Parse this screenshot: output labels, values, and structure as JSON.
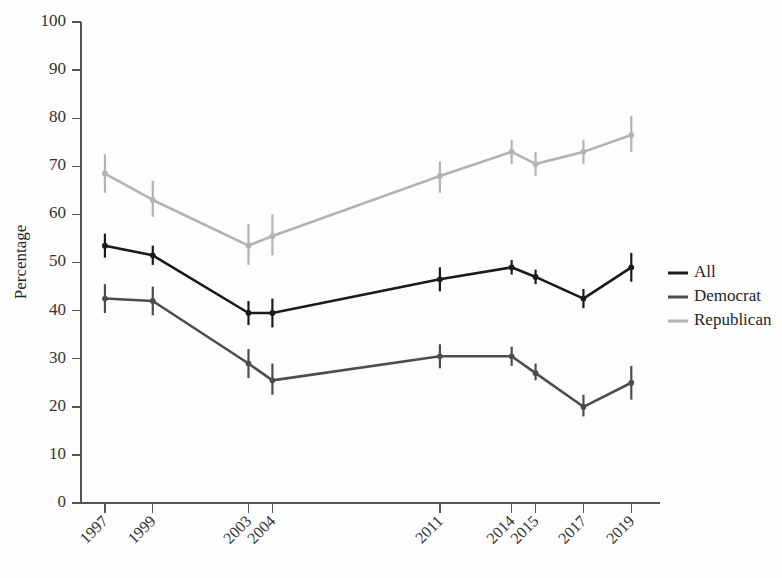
{
  "chart_data": {
    "type": "line",
    "title": "",
    "subtitle": "",
    "xlabel": "",
    "ylabel": "Percentage",
    "categories": [
      "1997",
      "1999",
      "2003",
      "2004",
      "2011",
      "2014",
      "2015",
      "2017",
      "2019"
    ],
    "x_positions": [
      1997,
      1999,
      2003,
      2004,
      2011,
      2014,
      2015,
      2017,
      2019
    ],
    "xlim": [
      1996.0,
      2020.2
    ],
    "ylim": [
      0,
      100
    ],
    "yticks": [
      0,
      10,
      20,
      30,
      40,
      50,
      60,
      70,
      80,
      90,
      100
    ],
    "ytick_labels": [
      "0",
      "10",
      "20",
      "30",
      "40",
      "50",
      "60",
      "70",
      "80",
      "90",
      "100"
    ],
    "grid": false,
    "error_bars": true,
    "legend_position": "right",
    "series": [
      {
        "name": "All",
        "color": "#1a1a1a",
        "values": [
          53.5,
          51.5,
          39.5,
          39.5,
          46.5,
          49.0,
          47.0,
          42.5,
          49.0
        ],
        "err_low": [
          51.0,
          49.5,
          37.0,
          36.5,
          44.0,
          47.5,
          45.5,
          40.5,
          46.0
        ],
        "err_high": [
          56.0,
          53.5,
          42.0,
          42.5,
          49.0,
          50.5,
          48.5,
          44.5,
          52.0
        ]
      },
      {
        "name": "Democrat",
        "color": "#4d4d4d",
        "values": [
          42.5,
          42.0,
          29.0,
          25.5,
          30.5,
          30.5,
          27.0,
          20.0,
          25.0
        ],
        "err_low": [
          39.5,
          39.0,
          26.0,
          22.5,
          28.0,
          28.5,
          25.5,
          18.0,
          21.5
        ],
        "err_high": [
          45.5,
          45.0,
          32.0,
          29.0,
          33.0,
          32.5,
          29.0,
          22.5,
          28.5
        ]
      },
      {
        "name": "Republican",
        "color": "#b3b3b3",
        "values": [
          68.5,
          63.0,
          53.5,
          55.5,
          68.0,
          73.0,
          70.5,
          73.0,
          76.5
        ],
        "err_low": [
          64.5,
          59.5,
          49.5,
          51.5,
          64.5,
          70.5,
          68.0,
          70.5,
          73.0
        ],
        "err_high": [
          72.5,
          67.0,
          58.0,
          60.0,
          71.0,
          75.5,
          73.0,
          75.5,
          80.5
        ]
      }
    ],
    "legend": [
      {
        "label": "All",
        "color": "#1a1a1a"
      },
      {
        "label": "Democrat",
        "color": "#4d4d4d"
      },
      {
        "label": "Republican",
        "color": "#b3b3b3"
      }
    ]
  }
}
